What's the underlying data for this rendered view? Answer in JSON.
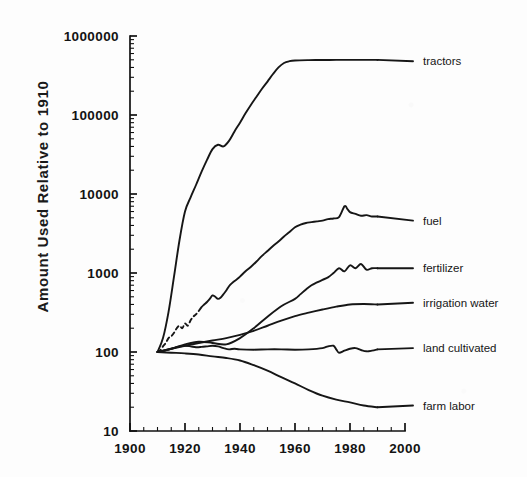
{
  "chart_data": {
    "type": "line",
    "title": "",
    "subtitle": "",
    "xlabel": "",
    "ylabel": "Amount Used Relative to 1910",
    "xlim": [
      1900,
      2000
    ],
    "ylim": [
      10,
      1000000
    ],
    "yscale": "log",
    "xscale": "linear",
    "grid": false,
    "legend_position": "right-of-axes-inline-labels",
    "x_ticks": [
      1900,
      1920,
      1940,
      1960,
      1980,
      2000
    ],
    "x_tick_labels": [
      "1900",
      "1920",
      "1940",
      "1960",
      "1980",
      "2000"
    ],
    "y_ticks": [
      10,
      100,
      1000,
      10000,
      100000,
      1000000
    ],
    "y_tick_labels": [
      "10",
      "100",
      "1000",
      "10000",
      "100000",
      "1000000"
    ],
    "y_minor_ticks": true,
    "data_x_range": [
      1910,
      1990
    ],
    "baseline_year": 1910,
    "baseline_value": 100,
    "series": [
      {
        "name": "tractors",
        "label": "tractors",
        "label_x": 1996,
        "label_y": 480000,
        "style": "solid",
        "x": [
          1910,
          1912,
          1914,
          1916,
          1918,
          1920,
          1922,
          1924,
          1926,
          1928,
          1930,
          1932,
          1934,
          1936,
          1938,
          1940,
          1942,
          1944,
          1946,
          1948,
          1950,
          1952,
          1954,
          1956,
          1958,
          1960,
          1965,
          1970,
          1975,
          1980,
          1985,
          1990
        ],
        "values": [
          100,
          150,
          320,
          900,
          2600,
          6000,
          9000,
          13000,
          19000,
          27000,
          37000,
          42000,
          40000,
          47000,
          62000,
          80000,
          105000,
          135000,
          170000,
          215000,
          265000,
          330000,
          400000,
          455000,
          480000,
          490000,
          495000,
          497000,
          498000,
          498000,
          498000,
          498000
        ]
      },
      {
        "name": "fuel",
        "label": "fuel",
        "label_x": 1996,
        "label_y": 4600,
        "style": "dashed-then-solid",
        "dashed_x_range": [
          1911,
          1925
        ],
        "x": [
          1910,
          1911,
          1912,
          1913,
          1914,
          1915,
          1916,
          1917,
          1918,
          1919,
          1920,
          1921,
          1922,
          1923,
          1924,
          1925,
          1926,
          1927,
          1928,
          1929,
          1930,
          1931,
          1932,
          1933,
          1934,
          1935,
          1936,
          1937,
          1938,
          1939,
          1940,
          1942,
          1944,
          1946,
          1948,
          1950,
          1952,
          1954,
          1956,
          1958,
          1960,
          1962,
          1964,
          1966,
          1968,
          1970,
          1972,
          1974,
          1976,
          1978,
          1979,
          1980,
          1982,
          1984,
          1986,
          1988,
          1990
        ],
        "values": [
          100,
          105,
          118,
          130,
          150,
          158,
          175,
          200,
          215,
          200,
          230,
          215,
          250,
          280,
          300,
          330,
          370,
          400,
          430,
          470,
          520,
          500,
          470,
          490,
          540,
          600,
          680,
          740,
          790,
          840,
          900,
          1050,
          1200,
          1400,
          1650,
          1900,
          2200,
          2500,
          2900,
          3300,
          3800,
          4100,
          4300,
          4400,
          4500,
          4600,
          4800,
          4900,
          5100,
          7000,
          6500,
          5900,
          5600,
          5300,
          5400,
          5200,
          5200
        ]
      },
      {
        "name": "fertilizer",
        "label": "fertilizer",
        "label_x": 1996,
        "label_y": 1150,
        "style": "solid",
        "x": [
          1910,
          1915,
          1920,
          1925,
          1930,
          1935,
          1940,
          1945,
          1950,
          1955,
          1960,
          1962,
          1964,
          1966,
          1968,
          1970,
          1972,
          1974,
          1976,
          1978,
          1980,
          1982,
          1984,
          1986,
          1988,
          1990
        ],
        "values": [
          100,
          110,
          125,
          135,
          130,
          125,
          150,
          200,
          280,
          380,
          470,
          540,
          620,
          700,
          760,
          820,
          880,
          1000,
          1150,
          1050,
          1250,
          1150,
          1300,
          1100,
          1150,
          1150
        ]
      },
      {
        "name": "irrigation water",
        "label": "irrigation water",
        "label_x": 1996,
        "label_y": 420,
        "style": "solid",
        "x": [
          1910,
          1915,
          1920,
          1925,
          1930,
          1935,
          1940,
          1945,
          1950,
          1955,
          1960,
          1965,
          1970,
          1975,
          1980,
          1985,
          1990
        ],
        "values": [
          100,
          110,
          120,
          130,
          140,
          150,
          165,
          185,
          215,
          250,
          285,
          315,
          345,
          375,
          400,
          405,
          400
        ]
      },
      {
        "name": "land cultivated",
        "label": "land cultivated",
        "label_x": 1996,
        "label_y": 112,
        "style": "solid",
        "x": [
          1910,
          1912,
          1914,
          1916,
          1918,
          1920,
          1922,
          1924,
          1926,
          1928,
          1930,
          1932,
          1934,
          1936,
          1938,
          1940,
          1945,
          1950,
          1955,
          1960,
          1965,
          1970,
          1972,
          1974,
          1975,
          1976,
          1978,
          1980,
          1982,
          1984,
          1986,
          1988,
          1990
        ],
        "values": [
          100,
          103,
          107,
          112,
          118,
          120,
          118,
          115,
          116,
          118,
          120,
          118,
          112,
          108,
          110,
          108,
          107,
          108,
          108,
          107,
          108,
          112,
          118,
          120,
          108,
          98,
          104,
          110,
          112,
          106,
          102,
          104,
          108
        ]
      },
      {
        "name": "farm labor",
        "label": "farm labor",
        "label_x": 1996,
        "label_y": 21,
        "style": "solid",
        "x": [
          1910,
          1915,
          1920,
          1925,
          1930,
          1935,
          1940,
          1945,
          1950,
          1955,
          1960,
          1965,
          1970,
          1975,
          1980,
          1985,
          1990
        ],
        "values": [
          100,
          98,
          96,
          93,
          88,
          84,
          78,
          68,
          58,
          48,
          40,
          33,
          28,
          25,
          23,
          21,
          20
        ]
      }
    ]
  }
}
